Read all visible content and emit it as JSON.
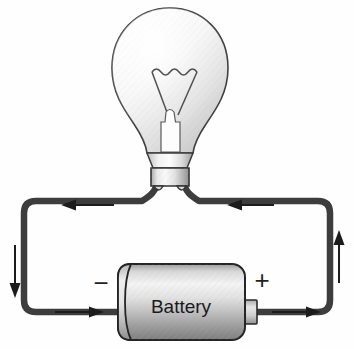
{
  "diagram": {
    "background_color": "#fefefe",
    "components": {
      "bulb": {
        "name": "light-bulb",
        "glass_fill_light": "#fdfdfd",
        "glass_fill_dark": "#c9c9c9",
        "outline_color": "#3a3a3a",
        "filament_color": "#4a4a4a",
        "base_fill_light": "#f2f2f2",
        "base_fill_dark": "#9a9a9a"
      },
      "battery": {
        "name": "battery",
        "label": "Battery",
        "positive_terminal_label": "+",
        "negative_terminal_label": "−",
        "body_fill_light": "#efefef",
        "body_fill_dark": "#8d8d8d",
        "outline_color": "#2b2b2b"
      },
      "wire": {
        "name": "circuit-wire",
        "color": "#3d3d3d",
        "width_px": 6
      }
    },
    "current_arrows": [
      {
        "id": "arrow-top-left",
        "label": "current-direction-left",
        "direction": "left",
        "x": 62,
        "y": 205,
        "length": 52
      },
      {
        "id": "arrow-top-right",
        "label": "current-direction-left",
        "direction": "left",
        "x": 228,
        "y": 205,
        "length": 46
      },
      {
        "id": "arrow-left-side",
        "label": "current-direction-down",
        "direction": "down",
        "x": 15,
        "y": 245,
        "length": 52
      },
      {
        "id": "arrow-right-side",
        "label": "current-direction-up",
        "direction": "up",
        "x": 339,
        "y": 230,
        "length": 52
      },
      {
        "id": "arrow-bottom-left",
        "label": "current-direction-right",
        "direction": "right",
        "x": 55,
        "y": 312,
        "length": 52
      },
      {
        "id": "arrow-bottom-right",
        "label": "current-direction-right",
        "direction": "right",
        "x": 272,
        "y": 312,
        "length": 52
      }
    ]
  }
}
